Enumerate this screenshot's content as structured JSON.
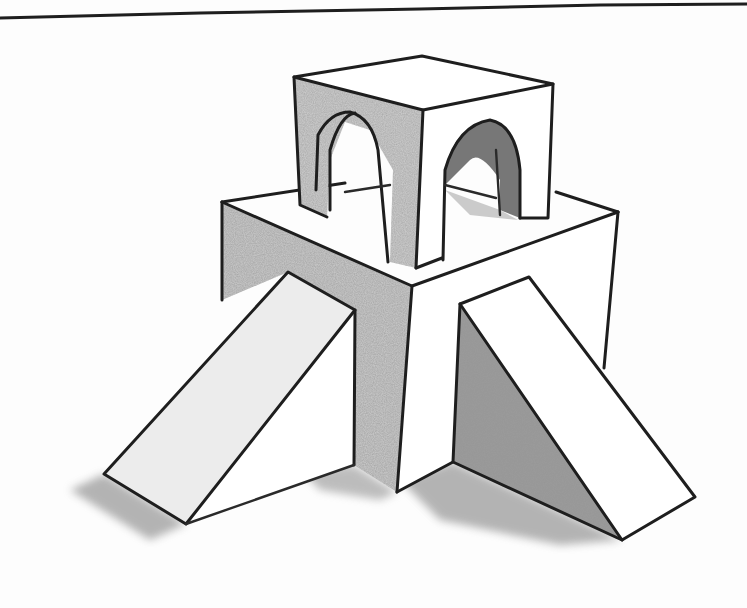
{
  "image": {
    "description": "Pencil sketch of stacked geometric blocks: a cube with two arches sitting on a larger box, flanked by two ramps (wedges) with cast shadows",
    "colors": {
      "line": "#1e1e1e",
      "shade_light": "#bdbdbd",
      "shade_mid": "#9a9a9a",
      "shade_dark": "#5a5a5a",
      "paper": "#fdfdfd"
    }
  },
  "objects": [
    {
      "name": "top-cube-with-arches"
    },
    {
      "name": "lower-box"
    },
    {
      "name": "left-ramp"
    },
    {
      "name": "right-ramp"
    }
  ]
}
